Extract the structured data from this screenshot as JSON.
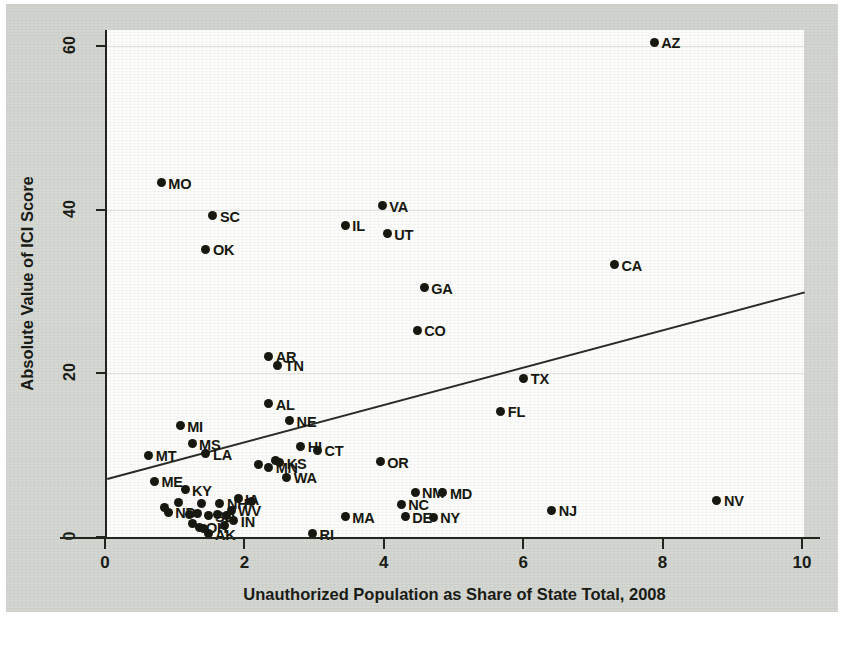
{
  "chart_data": {
    "type": "scatter",
    "title": "",
    "xlabel": "Unauthorized Population as Share of State Total, 2008",
    "ylabel": "Absolute Value of ICI Score",
    "xlim": [
      0,
      10
    ],
    "ylim": [
      0,
      62
    ],
    "xticks": [
      0,
      2,
      4,
      6,
      8,
      10
    ],
    "xtick_labels": [
      "0",
      "2",
      "4",
      "6",
      "8",
      "10"
    ],
    "yticks": [
      0,
      20,
      40,
      60
    ],
    "ytick_labels": [
      "0",
      "20",
      "40",
      "60"
    ],
    "grid": true,
    "grid_axis": "y",
    "legend": "none",
    "point_label_position": "right",
    "trendline": {
      "type": "linear-fit",
      "x_start": 0,
      "y_start": 7.2,
      "x_end": 10,
      "y_end": 30.0,
      "color": "#2a2c26"
    },
    "marker": {
      "shape": "circle",
      "color": "#17180f",
      "size_px": 9
    },
    "points": [
      {
        "label": "AZ",
        "x": 7.85,
        "y": 60.5
      },
      {
        "label": "MO",
        "x": 0.78,
        "y": 43.3
      },
      {
        "label": "VA",
        "x": 3.95,
        "y": 40.5
      },
      {
        "label": "SC",
        "x": 1.52,
        "y": 39.3
      },
      {
        "label": "IL",
        "x": 3.42,
        "y": 38.1
      },
      {
        "label": "UT",
        "x": 4.02,
        "y": 37.1
      },
      {
        "label": "OK",
        "x": 1.42,
        "y": 35.2
      },
      {
        "label": "CA",
        "x": 7.28,
        "y": 33.3
      },
      {
        "label": "GA",
        "x": 4.55,
        "y": 30.5
      },
      {
        "label": "CO",
        "x": 4.45,
        "y": 25.3
      },
      {
        "label": "AR",
        "x": 2.32,
        "y": 22.1
      },
      {
        "label": "TN",
        "x": 2.45,
        "y": 21.0
      },
      {
        "label": "TX",
        "x": 5.98,
        "y": 19.4
      },
      {
        "label": "FL",
        "x": 5.65,
        "y": 15.4
      },
      {
        "label": "AL",
        "x": 2.32,
        "y": 16.3
      },
      {
        "label": "NE",
        "x": 2.62,
        "y": 14.2
      },
      {
        "label": "MI",
        "x": 1.05,
        "y": 13.6
      },
      {
        "label": "HI",
        "x": 2.78,
        "y": 11.1
      },
      {
        "label": "MS",
        "x": 1.22,
        "y": 11.4
      },
      {
        "label": "CT",
        "x": 3.02,
        "y": 10.6
      },
      {
        "label": "LA",
        "x": 1.42,
        "y": 10.2
      },
      {
        "label": "MT",
        "x": 0.6,
        "y": 10.0
      },
      {
        "label": "KS",
        "x": 2.48,
        "y": 9.1
      },
      {
        "label": "MN",
        "x": 2.32,
        "y": 8.5
      },
      {
        "label": "OR",
        "x": 3.92,
        "y": 9.2
      },
      {
        "label": "WA",
        "x": 2.58,
        "y": 7.3
      },
      {
        "label": "ME",
        "x": 0.68,
        "y": 6.8
      },
      {
        "label": "KY",
        "x": 1.12,
        "y": 5.8
      },
      {
        "label": "NM",
        "x": 4.42,
        "y": 5.5
      },
      {
        "label": "MD",
        "x": 4.82,
        "y": 5.4
      },
      {
        "label": "IA",
        "x": 1.88,
        "y": 4.7
      },
      {
        "label": "NH",
        "x": 1.62,
        "y": 4.1
      },
      {
        "label": "NC",
        "x": 4.22,
        "y": 4.0
      },
      {
        "label": "NV",
        "x": 8.75,
        "y": 4.5
      },
      {
        "label": "WV",
        "x": 1.78,
        "y": 3.3
      },
      {
        "label": "NJ",
        "x": 6.38,
        "y": 3.3
      },
      {
        "label": "ND",
        "x": 0.88,
        "y": 3.0
      },
      {
        "label": "SD",
        "x": 1.45,
        "y": 2.6
      },
      {
        "label": "DE",
        "x": 4.28,
        "y": 2.5
      },
      {
        "label": "MA",
        "x": 3.42,
        "y": 2.5
      },
      {
        "label": "NY",
        "x": 4.68,
        "y": 2.4
      },
      {
        "label": "IN",
        "x": 1.82,
        "y": 2.0
      },
      {
        "label": "OH",
        "x": 1.32,
        "y": 1.2
      },
      {
        "label": "AK",
        "x": 1.45,
        "y": 0.4
      },
      {
        "label": "RI",
        "x": 2.95,
        "y": 0.4
      }
    ],
    "extra_markers": [
      {
        "x": 0.82,
        "y": 3.6
      },
      {
        "x": 1.02,
        "y": 4.2
      },
      {
        "x": 1.18,
        "y": 2.8
      },
      {
        "x": 1.3,
        "y": 2.9
      },
      {
        "x": 1.58,
        "y": 2.7
      },
      {
        "x": 1.72,
        "y": 2.6
      },
      {
        "x": 1.38,
        "y": 1.0
      },
      {
        "x": 1.22,
        "y": 1.6
      },
      {
        "x": 1.68,
        "y": 1.4
      },
      {
        "x": 2.18,
        "y": 8.9
      },
      {
        "x": 2.42,
        "y": 9.3
      },
      {
        "x": 1.35,
        "y": 4.1
      },
      {
        "x": 2.08,
        "y": 4.4
      }
    ]
  },
  "colors": {
    "page_background": "#d5d7d2",
    "plot_background": "#fdfdfb",
    "axis": "#23251f",
    "grid": "#e2e2dd",
    "marker": "#17180f",
    "trendline": "#2a2c26"
  }
}
